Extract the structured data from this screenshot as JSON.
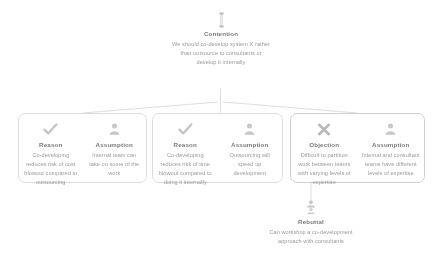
{
  "diagram": {
    "kind": "argument-map",
    "background": "#ffffff",
    "line_color": "#d2d2d2",
    "card_border_color": "#dcdcdc",
    "type_label_color": "#7b7b7b",
    "body_text_color": "#9a9a9a"
  },
  "root": {
    "icon": "scales-icon",
    "type_label": "Contention",
    "body": "We should co-develop system X rather than outsource to consultants or develop it internally"
  },
  "cards": [
    {
      "id": "card-1",
      "claims": [
        {
          "icon": "check-icon",
          "type_label": "Reason",
          "body": "Co-developing reduces risk of cost blowout compared to outsourcing"
        },
        {
          "icon": "person-icon",
          "type_label": "Assumption",
          "body": "Internal team can take on some of the work"
        }
      ]
    },
    {
      "id": "card-2",
      "claims": [
        {
          "icon": "check-icon",
          "type_label": "Reason",
          "body": "Co-developing reduces risk of time blowout compared to doing it internally"
        },
        {
          "icon": "person-icon",
          "type_label": "Assumption",
          "body": "Outsourcing will speed up development"
        }
      ]
    },
    {
      "id": "card-3",
      "claims": [
        {
          "icon": "cross-icon",
          "type_label": "Objection",
          "body": "Difficult to partition work between teams with varying levels of expertise"
        },
        {
          "icon": "person-icon",
          "type_label": "Assumption",
          "body": "Internal and consultant teams have different levels of expertise"
        }
      ]
    }
  ],
  "rebuttal": {
    "icon": "rebuttal-icon",
    "type_label": "Rebuttal",
    "body": "Can workshop a co-development approach with consultants"
  }
}
